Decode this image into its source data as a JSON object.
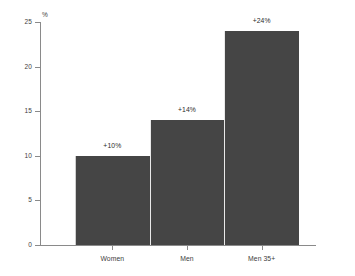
{
  "chart_data": {
    "type": "bar",
    "title": "",
    "subtitle": "",
    "xlabel": "",
    "ylabel": "%",
    "categories": [
      "Women",
      "Men",
      "Men 35+"
    ],
    "values": [
      10,
      14,
      24
    ],
    "data_labels": [
      "+10%",
      "+14%",
      "+24%"
    ],
    "series": [
      {
        "name": "",
        "values": [
          10,
          14,
          24
        ]
      }
    ],
    "ylim": [
      0,
      25
    ],
    "yticks": [
      0,
      5,
      10,
      15,
      20,
      25
    ],
    "ytick_labels": [
      "0",
      "5",
      "10",
      "15",
      "20",
      "25"
    ],
    "grid": false,
    "legend": false,
    "legend_position": "none",
    "bar_color": "#454545",
    "axis_color": "#8a8a8a",
    "text_color": "#3d3d3d",
    "background_color": "#ffffff",
    "annotations": []
  }
}
